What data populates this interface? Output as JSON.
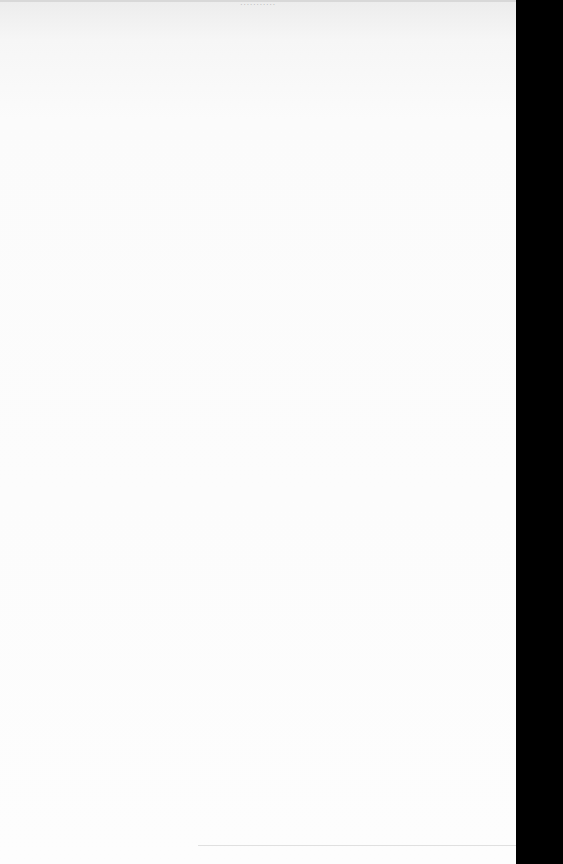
{
  "document": {
    "running_header": "...........",
    "body_text": ""
  },
  "colors": {
    "page": "#fbfbfb",
    "margin": "#000000"
  }
}
